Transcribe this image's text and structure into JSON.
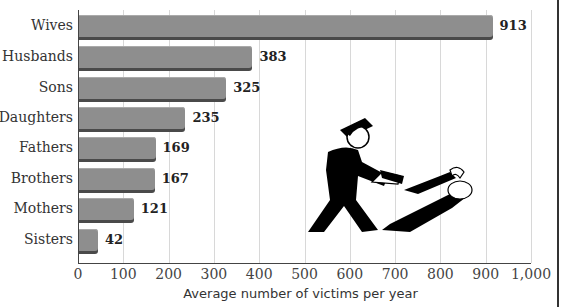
{
  "chart_data": {
    "type": "bar",
    "orientation": "horizontal",
    "title": "",
    "xlabel": "Average number of victims per year",
    "ylabel": "",
    "categories": [
      "Wives",
      "Husbands",
      "Sons",
      "Daughters",
      "Fathers",
      "Brothers",
      "Mothers",
      "Sisters"
    ],
    "values": [
      913,
      383,
      325,
      235,
      169,
      167,
      121,
      42
    ],
    "xlim": [
      0,
      1000
    ],
    "xticks": [
      "0",
      "100",
      "200",
      "300",
      "400",
      "500",
      "600",
      "700",
      "800",
      "900",
      "1,000"
    ],
    "grid": "vertical",
    "legend": null,
    "annotations": [
      "Illustration of a man pointing a gun at another figure"
    ]
  },
  "labels": {
    "cat": [
      "Wives",
      "Husbands",
      "Sons",
      "Daughters",
      "Fathers",
      "Brothers",
      "Mothers",
      "Sisters"
    ],
    "val": [
      "913",
      "383",
      "325",
      "235",
      "169",
      "167",
      "121",
      "42"
    ],
    "ticks": [
      "0",
      "100",
      "200",
      "300",
      "400",
      "500",
      "600",
      "700",
      "800",
      "900",
      "1,000"
    ],
    "xlabel": "Average number of victims per year"
  },
  "colors": {
    "bar": "#8e8e8e",
    "bar_shadow": "#4a4a4a",
    "grid": "#d8d8d8"
  }
}
